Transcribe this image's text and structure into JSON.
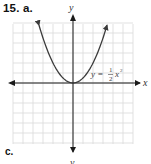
{
  "problem": {
    "number_label": "15. a.",
    "next_part_label": "c."
  },
  "graph": {
    "x_axis_label": "x",
    "y_axis_label": "y",
    "y_axis_label_bottom": "y",
    "equation": {
      "lhs": "y =",
      "numerator": "1",
      "denominator": "2",
      "rhs": "x",
      "exponent": "2",
      "full_text": "y = 1/2 x^2"
    },
    "colors": {
      "grid": "#d9d9d9",
      "axis": "#1a1a1a",
      "curve": "#3a3a3a",
      "background": "#ffffff"
    }
  },
  "chart_data": {
    "type": "line",
    "title": "15. a.",
    "xlabel": "x",
    "ylabel": "y",
    "function": "y = (1/2) x^2",
    "grid": true,
    "xlim": [
      -6,
      6
    ],
    "ylim": [
      -6,
      6
    ],
    "grid_step": 1,
    "tick_labels": [],
    "arrows": {
      "axes_both_ends": true,
      "curve_both_ends": true
    },
    "series": [
      {
        "name": "y = 1/2 x^2",
        "x": [
          -3.4,
          -3,
          -2,
          -1,
          0,
          1,
          2,
          3,
          3.4
        ],
        "y": [
          5.78,
          4.5,
          2,
          0.5,
          0,
          0.5,
          2,
          4.5,
          5.78
        ]
      }
    ],
    "annotations": [
      {
        "text": "y = 1/2 x^2",
        "x": 5.2,
        "y": 1.5
      }
    ],
    "legend": null
  }
}
